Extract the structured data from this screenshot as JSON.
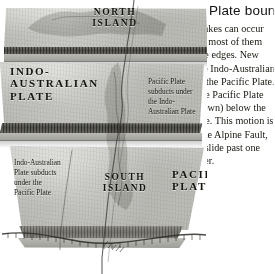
{
  "figure": {
    "palette": {
      "paper": "#ffffff",
      "slab_top": "#c2c2bd",
      "slab_side": "#a9a9a4",
      "rock_dark": "#4c4b46",
      "rock_light": "#6e6d67",
      "text": "#15140f"
    }
  },
  "diagram": {
    "plate_labels": [
      {
        "id": "indo-australian-plate",
        "text": "INDO-\nAUSTRALIAN\nPLATE"
      },
      {
        "id": "pacific-plate",
        "text": "PACIFIC\nPLATE"
      }
    ],
    "island_labels": [
      {
        "id": "north-island",
        "text": "NORTH\nISLAND"
      },
      {
        "id": "south-island",
        "text": "SOUTH\nISLAND"
      }
    ],
    "captions": [
      {
        "id": "pacific-subducts",
        "text": "Pacific Plate\nsubducts under\nthe Indo-\nAustralian Plate"
      },
      {
        "id": "indo-australian-subducts",
        "text": "Indo-Australian\nPlate subducts\nunder the\nPacific Plate"
      }
    ]
  },
  "sidebar": {
    "heading": "Plate boundaries",
    "body": "Although earthquakes can occur almost anywhere, most of them happen near plate edges. New Zealand straddles the Indo-Australian Plate boundary with the Pacific Plate.\nIn North Island the Pacific Plate subducts (slides down) below the Indo-Australian Plate. This motion is taken up through the Alpine Fault, where the plates slide past one another."
  }
}
